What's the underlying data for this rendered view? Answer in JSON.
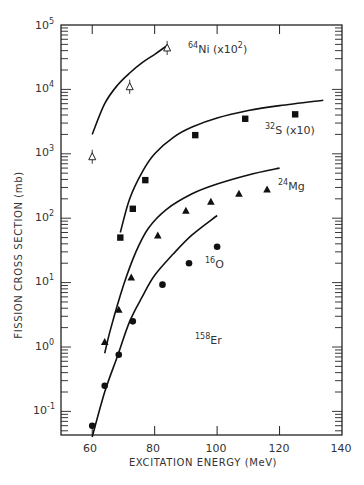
{
  "chart_data": {
    "type": "scatter",
    "title": "",
    "xlabel": "EXCITATION ENERGY (MeV)",
    "ylabel": "FISSION CROSS SECTION (mb)",
    "xlim": [
      50,
      140
    ],
    "ylim": [
      0.0365,
      100000
    ],
    "yscale": "log",
    "x_ticks": [
      60,
      80,
      100,
      120,
      140
    ],
    "y_ticks": [
      "10^-1",
      "10^0",
      "10^1",
      "10^2",
      "10^3",
      "10^4",
      "10^5"
    ],
    "grid": false,
    "legend": "none (inline annotations)",
    "annotations": [
      "64Ni (x10^2)",
      "32S (x10)",
      "24Mg",
      "16O",
      "158Er"
    ],
    "compound_nucleus": "158Er",
    "series": [
      {
        "name": "64Ni (x10^2)",
        "marker": "open-triangle-with-error-bar",
        "x": [
          60,
          72,
          84
        ],
        "y": [
          900,
          11000,
          44000
        ],
        "curve": {
          "x": [
            60,
            64,
            68,
            72,
            76,
            80,
            84
          ],
          "y": [
            2000,
            6000,
            11500,
            18000,
            26000,
            35000,
            48000
          ]
        }
      },
      {
        "name": "32S (x10)",
        "marker": "filled-square",
        "x": [
          69,
          73,
          77,
          93,
          109,
          125
        ],
        "y": [
          50,
          140,
          390,
          1950,
          3500,
          4100
        ],
        "curve": {
          "x": [
            69,
            72,
            76,
            80,
            86,
            92,
            100,
            110,
            120,
            134
          ],
          "y": [
            60,
            200,
            520,
            1000,
            1800,
            2600,
            3600,
            4700,
            5600,
            6800
          ]
        }
      },
      {
        "name": "24Mg",
        "marker": "filled-triangle",
        "x": [
          64,
          68.5,
          72.5,
          81,
          90,
          98,
          107,
          116
        ],
        "y": [
          1.2,
          3.8,
          12,
          54,
          130,
          180,
          240,
          280
        ],
        "curve": {
          "x": [
            64,
            66,
            70,
            74,
            78,
            84,
            92,
            100,
            110,
            120
          ],
          "y": [
            0.8,
            2,
            9,
            30,
            70,
            140,
            240,
            340,
            470,
            600
          ]
        }
      },
      {
        "name": "16O",
        "marker": "filled-circle",
        "x": [
          60,
          64,
          68.5,
          73,
          82.5,
          91,
          100
        ],
        "y": [
          0.06,
          0.25,
          0.76,
          2.5,
          9.3,
          20,
          36
        ],
        "curve": {
          "x": [
            60,
            64,
            68,
            72,
            76,
            80,
            86,
            92,
            100
          ],
          "y": [
            0.04,
            0.2,
            0.7,
            2.5,
            6,
            13,
            28,
            55,
            110
          ]
        }
      }
    ]
  },
  "labels": {
    "x_title": "EXCITATION ENERGY (MeV)",
    "y_title": "FISSION CROSS SECTION (mb)",
    "x_tick_labels": [
      "60",
      "80",
      "100",
      "120",
      "140"
    ],
    "y_tick_bases": [
      "10",
      "10",
      "10",
      "10",
      "10",
      "10",
      "10"
    ],
    "y_tick_exps": [
      "-1",
      "0",
      "1",
      "2",
      "3",
      "4",
      "5"
    ],
    "ni_mass": "64",
    "ni_sym": "Ni (x10",
    "ni_exp": "2",
    "ni_close": ")",
    "s_mass": "32",
    "s_sym": "S (x10)",
    "mg_mass": "24",
    "mg_sym": "Mg",
    "o_mass": "16",
    "o_sym": "O",
    "er_mass": "158",
    "er_sym": "Er"
  }
}
